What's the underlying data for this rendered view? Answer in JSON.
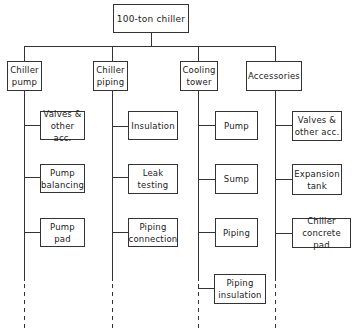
{
  "diagram": {
    "type": "work-breakdown-tree",
    "root": {
      "label": "100-ton chiller"
    },
    "branches": [
      {
        "label": "Chiller\npump",
        "children": [
          "Valves &\nother acc.",
          "Pump\nbalancing",
          "Pump\npad"
        ]
      },
      {
        "label": "Chiller\npiping",
        "children": [
          "Insulation",
          "Leak\ntesting",
          "Piping\nconnection"
        ]
      },
      {
        "label": "Cooling\ntower",
        "children": [
          "Pump",
          "Sump",
          "Piping",
          "Piping\ninsulation"
        ]
      },
      {
        "label": "Accessories",
        "children": [
          "Valves &\nother acc.",
          "Expansion\ntank",
          "Chiller\nconcrete pad"
        ]
      }
    ],
    "continuation": "dashed lines indicate additional items"
  },
  "labels": {
    "root": "100-ton chiller",
    "b0": "Chiller pump",
    "b1": "Chiller piping",
    "b2": "Cooling tower",
    "b3": "Accessories",
    "b0c0": "Valves & other acc.",
    "b0c1": "Pump balancing",
    "b0c2": "Pump pad",
    "b1c0": "Insulation",
    "b1c1": "Leak testing",
    "b1c2": "Piping connection",
    "b2c0": "Pump",
    "b2c1": "Sump",
    "b2c2": "Piping",
    "b2c3": "Piping insulation",
    "b3c0": "Valves & other acc.",
    "b3c1": "Expansion tank",
    "b3c2": "Chiller concrete pad"
  }
}
